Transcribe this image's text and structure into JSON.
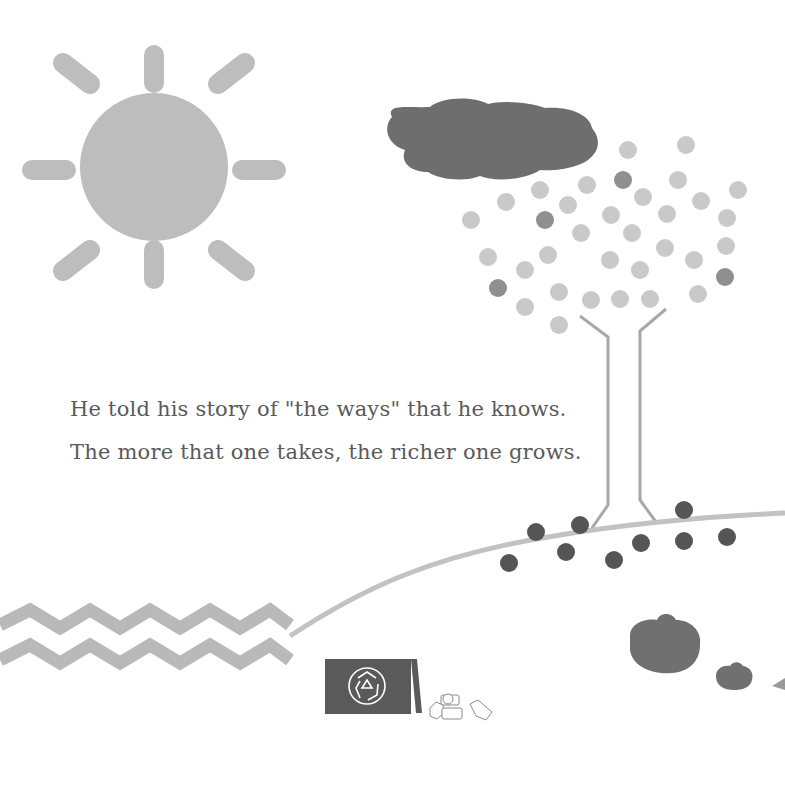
{
  "page": {
    "verse_lines": [
      "He told his story of \"the ways\" that he knows.",
      "The more that one takes, the richer one grows."
    ]
  },
  "colors": {
    "background": "#ffffff",
    "sun": "#bdbdbd",
    "cloud": "#6e6e6e",
    "leaf_light": "#c9c9c9",
    "leaf_dark": "#8f8f8f",
    "trunk": "#a8a8a8",
    "hill": "#c2c2c2",
    "seed": "#555555",
    "water": "#b9b9b9",
    "bin": "#5a5a5a",
    "rock": "#707070"
  },
  "icons": {
    "recycle": "recycle-icon"
  }
}
